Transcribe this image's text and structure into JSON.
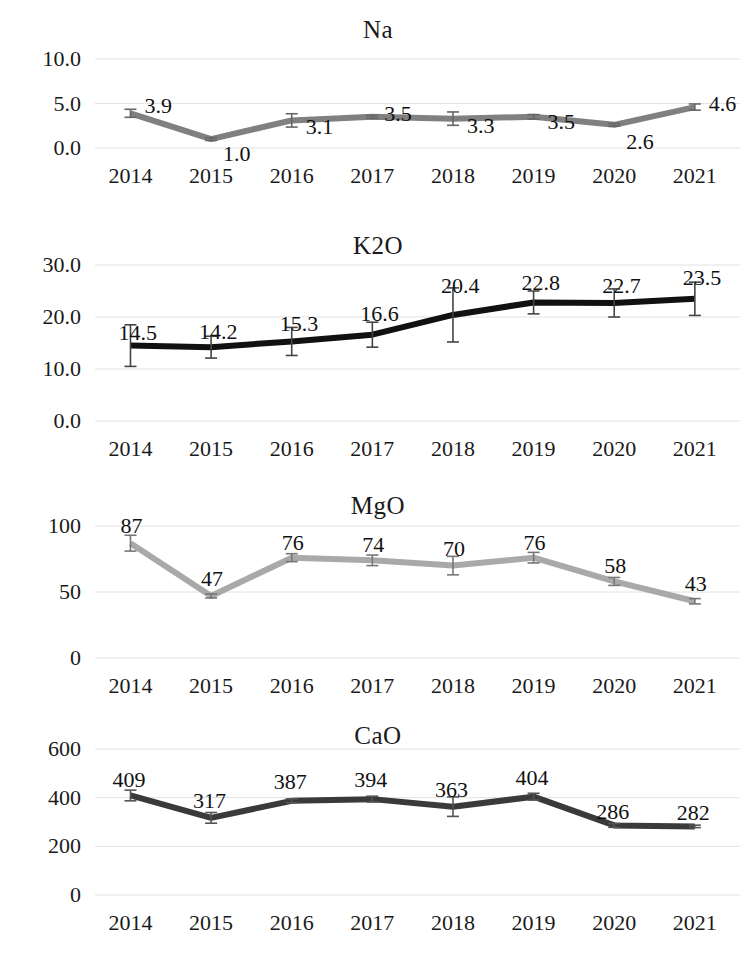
{
  "page": {
    "width": 756,
    "height": 967,
    "background": "#ffffff"
  },
  "chart_data": [
    {
      "type": "line",
      "title": "Na",
      "xlabel": "",
      "ylabel": "",
      "categories": [
        "2014",
        "2015",
        "2016",
        "2017",
        "2018",
        "2019",
        "2020",
        "2021"
      ],
      "values": [
        3.9,
        1.0,
        3.1,
        3.5,
        3.3,
        3.5,
        2.6,
        4.6
      ],
      "value_labels": [
        "3.9",
        "1.0",
        "3.1",
        "3.5",
        "3.3",
        "3.5",
        "2.6",
        "4.6"
      ],
      "errors": [
        0.45,
        0.15,
        0.75,
        0.15,
        0.75,
        0.25,
        0.15,
        0.35
      ],
      "ylim": [
        0.0,
        10.0
      ],
      "yticks": [
        0.0,
        5.0,
        10.0
      ],
      "ytick_labels": [
        "0.0",
        "5.0",
        "10.0"
      ],
      "grid": true,
      "legend": "none",
      "series_color": "#808080",
      "errorbar_color": "#666666"
    },
    {
      "type": "line",
      "title": "K2O",
      "xlabel": "",
      "ylabel": "",
      "categories": [
        "2014",
        "2015",
        "2016",
        "2017",
        "2018",
        "2019",
        "2020",
        "2021"
      ],
      "values": [
        14.5,
        14.2,
        15.3,
        16.6,
        20.4,
        22.8,
        22.7,
        23.5
      ],
      "value_labels": [
        "14.5",
        "14.2",
        "15.3",
        "16.6",
        "20.4",
        "22.8",
        "22.7",
        "23.5"
      ],
      "errors": [
        4.0,
        2.1,
        2.7,
        2.4,
        5.2,
        2.2,
        2.7,
        3.2
      ],
      "ylim": [
        0.0,
        30.0
      ],
      "yticks": [
        0.0,
        10.0,
        20.0,
        30.0
      ],
      "ytick_labels": [
        "0.0",
        "10.0",
        "20.0",
        "30.0"
      ],
      "grid": true,
      "legend": "none",
      "series_color": "#111111",
      "errorbar_color": "#444444"
    },
    {
      "type": "line",
      "title": "MgO",
      "xlabel": "",
      "ylabel": "",
      "categories": [
        "2014",
        "2015",
        "2016",
        "2017",
        "2018",
        "2019",
        "2020",
        "2021"
      ],
      "values": [
        87,
        47,
        76,
        74,
        70,
        76,
        58,
        43
      ],
      "value_labels": [
        "87",
        "47",
        "76",
        "74",
        "70",
        "76",
        "58",
        "43"
      ],
      "errors": [
        6,
        1.5,
        3,
        4,
        7,
        4,
        3,
        2
      ],
      "ylim": [
        0,
        100
      ],
      "yticks": [
        0,
        50,
        100
      ],
      "ytick_labels": [
        "0",
        "50",
        "100"
      ],
      "grid": true,
      "legend": "none",
      "series_color": "#a9a9a9",
      "errorbar_color": "#777777"
    },
    {
      "type": "line",
      "title": "CaO",
      "xlabel": "",
      "ylabel": "",
      "categories": [
        "2014",
        "2015",
        "2016",
        "2017",
        "2018",
        "2019",
        "2020",
        "2021"
      ],
      "values": [
        409,
        317,
        387,
        394,
        363,
        404,
        286,
        282
      ],
      "value_labels": [
        "409",
        "317",
        "387",
        "394",
        "363",
        "404",
        "286",
        "282"
      ],
      "errors": [
        22,
        22,
        8,
        12,
        40,
        14,
        8,
        5
      ],
      "ylim": [
        0,
        600
      ],
      "yticks": [
        0,
        200,
        400,
        600
      ],
      "ytick_labels": [
        "0",
        "200",
        "400",
        "600"
      ],
      "grid": true,
      "legend": "none",
      "series_color": "#3a3a3a",
      "errorbar_color": "#555555"
    }
  ],
  "layout": {
    "panels": [
      {
        "key": "na",
        "title_top": 16,
        "plot_left": 95,
        "plot_right": 740,
        "plot_top": 59,
        "plot_bottom": 148,
        "xaxis_label_y": 163,
        "label_offsets": [
          {
            "dx": 14,
            "dy": -20
          },
          {
            "dx": 12,
            "dy": 2
          },
          {
            "dx": 14,
            "dy": -6
          },
          {
            "dx": 12,
            "dy": -16
          },
          {
            "dx": 14,
            "dy": -6
          },
          {
            "dx": 14,
            "dy": -8
          },
          {
            "dx": 12,
            "dy": 4
          },
          {
            "dx": 14,
            "dy": -16
          }
        ]
      },
      {
        "key": "k2o",
        "title_top": 232,
        "plot_left": 95,
        "plot_right": 740,
        "plot_top": 265,
        "plot_bottom": 421,
        "xaxis_label_y": 436,
        "label_offsets": [
          {
            "dx": -12,
            "dy": -26
          },
          {
            "dx": -12,
            "dy": -28
          },
          {
            "dx": -12,
            "dy": -30
          },
          {
            "dx": -12,
            "dy": -34
          },
          {
            "dx": -12,
            "dy": -42
          },
          {
            "dx": -12,
            "dy": -32
          },
          {
            "dx": -12,
            "dy": -30
          },
          {
            "dx": -12,
            "dy": -34
          }
        ]
      },
      {
        "key": "mgo",
        "title_top": 492,
        "plot_left": 95,
        "plot_right": 740,
        "plot_top": 526,
        "plot_bottom": 658,
        "xaxis_label_y": 673,
        "label_offsets": [
          {
            "dx": -10,
            "dy": -30
          },
          {
            "dx": -10,
            "dy": -30
          },
          {
            "dx": -10,
            "dy": -28
          },
          {
            "dx": -10,
            "dy": -28
          },
          {
            "dx": -10,
            "dy": -30
          },
          {
            "dx": -10,
            "dy": -28
          },
          {
            "dx": -10,
            "dy": -28
          },
          {
            "dx": -10,
            "dy": -30
          }
        ]
      },
      {
        "key": "cao",
        "title_top": 722,
        "plot_left": 95,
        "plot_right": 740,
        "plot_top": 749,
        "plot_bottom": 895,
        "xaxis_label_y": 910,
        "label_offsets": [
          {
            "dx": -18,
            "dy": -28
          },
          {
            "dx": -18,
            "dy": -30
          },
          {
            "dx": -18,
            "dy": -32
          },
          {
            "dx": -18,
            "dy": -32
          },
          {
            "dx": -18,
            "dy": -30
          },
          {
            "dx": -18,
            "dy": -32
          },
          {
            "dx": -18,
            "dy": -26
          },
          {
            "dx": -18,
            "dy": -26
          }
        ]
      }
    ]
  }
}
